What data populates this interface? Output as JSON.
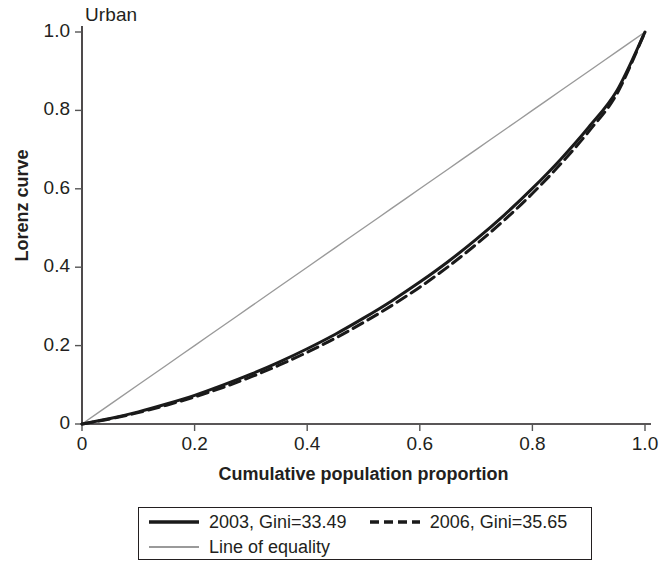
{
  "chart_data": {
    "type": "line",
    "title": "Urban",
    "xlabel": "Cumulative population proportion",
    "ylabel": "Lorenz curve",
    "xlim": [
      0,
      1
    ],
    "ylim": [
      0,
      1
    ],
    "grid": false,
    "legend_position": "bottom",
    "xticks": [
      "0",
      "0.2",
      "0.4",
      "0.6",
      "0.8",
      "1.0"
    ],
    "xtick_values": [
      0,
      0.2,
      0.4,
      0.6,
      0.8,
      1.0
    ],
    "yticks": [
      "0",
      "0.2",
      "0.4",
      "0.6",
      "0.8",
      "1.0"
    ],
    "ytick_values": [
      0,
      0.2,
      0.4,
      0.6,
      0.8,
      1.0
    ],
    "x": [
      0,
      0.05,
      0.1,
      0.15,
      0.2,
      0.25,
      0.3,
      0.35,
      0.4,
      0.45,
      0.5,
      0.55,
      0.6,
      0.65,
      0.7,
      0.75,
      0.8,
      0.85,
      0.9,
      0.95,
      1.0
    ],
    "series": [
      {
        "name": "2003, Gini=33.49",
        "style": "solid",
        "color": "#1a1a1a",
        "width": 3,
        "values": [
          0,
          0.014,
          0.031,
          0.051,
          0.073,
          0.099,
          0.127,
          0.158,
          0.192,
          0.229,
          0.27,
          0.314,
          0.362,
          0.414,
          0.471,
          0.533,
          0.601,
          0.675,
          0.757,
          0.85,
          1.0
        ]
      },
      {
        "name": "2006, Gini=35.65",
        "style": "dashed",
        "color": "#1a1a1a",
        "width": 3,
        "values": [
          0,
          0.013,
          0.029,
          0.048,
          0.069,
          0.093,
          0.12,
          0.15,
          0.183,
          0.219,
          0.259,
          0.302,
          0.349,
          0.401,
          0.458,
          0.52,
          0.588,
          0.663,
          0.746,
          0.842,
          1.0
        ]
      },
      {
        "name": "Line of equality",
        "style": "solid",
        "color": "#9a9a9a",
        "width": 1.4,
        "values": [
          0,
          0.05,
          0.1,
          0.15,
          0.2,
          0.25,
          0.3,
          0.35,
          0.4,
          0.45,
          0.5,
          0.55,
          0.6,
          0.65,
          0.7,
          0.75,
          0.8,
          0.85,
          0.9,
          0.95,
          1.0
        ]
      }
    ],
    "legend": [
      {
        "label": "2003, Gini=33.49",
        "style": "solid",
        "color": "#1a1a1a"
      },
      {
        "label": "2006, Gini=35.65",
        "style": "dashed",
        "color": "#1a1a1a"
      },
      {
        "label": "Line of equality",
        "style": "solid",
        "color": "#9a9a9a"
      }
    ]
  }
}
